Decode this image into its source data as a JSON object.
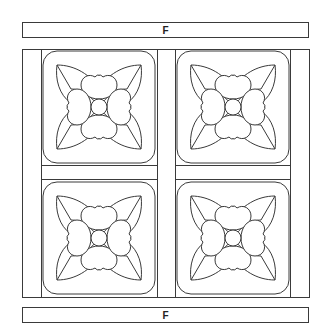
{
  "top_bar": {
    "label": "F"
  },
  "bottom_bar": {
    "label": "F"
  },
  "quilt": {
    "stroke_color": "#3a3a3a",
    "background": "#ffffff",
    "blocks": [
      {
        "id": "block-top-left",
        "motif": "flower-icon"
      },
      {
        "id": "block-top-right",
        "motif": "flower-icon"
      },
      {
        "id": "block-bottom-left",
        "motif": "flower-icon"
      },
      {
        "id": "block-bottom-right",
        "motif": "flower-icon"
      }
    ]
  }
}
